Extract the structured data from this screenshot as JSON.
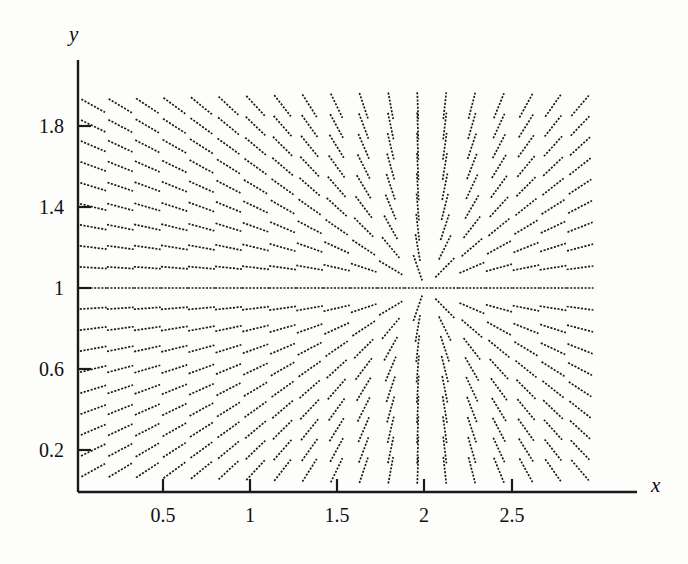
{
  "figure": {
    "width": 688,
    "height": 564,
    "background_color": "#fdfdfc",
    "ink_color": "#1a1a1a"
  },
  "axes": {
    "x_axis_label": "x",
    "y_axis_label": "y",
    "x_ticks": [
      {
        "label": "0.5",
        "value": 0.5,
        "px": 163
      },
      {
        "label": "1",
        "value": 1.0,
        "px": 250
      },
      {
        "label": "1.5",
        "value": 1.5,
        "px": 337
      },
      {
        "label": "2",
        "value": 2.0,
        "px": 424
      },
      {
        "label": "2.5",
        "value": 2.5,
        "px": 512
      }
    ],
    "y_ticks": [
      {
        "label": "1.8",
        "value": 1.8,
        "px": 126
      },
      {
        "label": "1.4",
        "value": 1.4,
        "px": 207
      },
      {
        "label": "1",
        "value": 1.0,
        "px": 288
      },
      {
        "label": "0.6",
        "value": 0.6,
        "px": 369
      },
      {
        "label": "0.2",
        "value": 0.2,
        "px": 450
      }
    ],
    "x_axis_y_px": 492,
    "y_axis_x_px": 78,
    "x_axis_end_px": 637,
    "y_axis_top_px": 60
  },
  "chart_data": {
    "type": "scatter",
    "title": "",
    "subtitle": "",
    "xlabel": "x",
    "ylabel": "y",
    "grid": false,
    "legend": "none",
    "plot_kind": "slope-field",
    "xlim": [
      0.07,
      2.95
    ],
    "ylim": [
      0.05,
      1.96
    ],
    "slope_formula": "dy/dx = (y - 1) / (x - 2)",
    "singular_point": {
      "x": 2.0,
      "y": 1.0
    },
    "grid_columns": 19,
    "grid_rows": 19,
    "grid_x_start": 0.1,
    "grid_x_step": 0.155,
    "grid_y_start": 0.1,
    "grid_y_step": 0.1,
    "segment_pixel_length": 27,
    "segment_style": "dashed",
    "x_tick_values": [
      0.5,
      1,
      1.5,
      2,
      2.5
    ],
    "y_tick_values": [
      0.2,
      0.6,
      1,
      1.4,
      1.8
    ],
    "x_tick_labels": [
      "0.5",
      "1",
      "1.5",
      "2",
      "2.5"
    ],
    "y_tick_labels": [
      "0.2",
      "0.6",
      "1",
      "1.4",
      "1.8"
    ]
  }
}
